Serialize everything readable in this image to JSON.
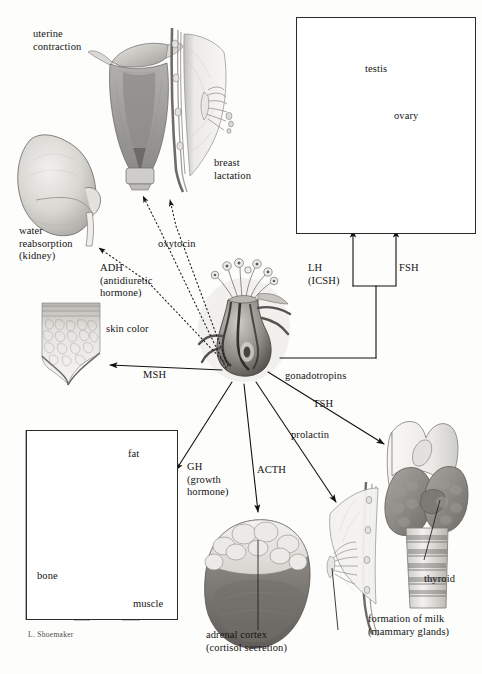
{
  "figure": {
    "signature": "L. Shoemaker",
    "background_color": "#fdfdfb",
    "ink_color": "#141414"
  },
  "labels": {
    "uterine_contraction": "uterine\ncontraction",
    "breast_lactation": "breast\nlactation",
    "water_reabsorption": "water\nreabsorption\n(kidney)",
    "adh": "ADH\n(antidiuretic\nhormone)",
    "oxytocin": "oxytocin",
    "skin_color": "skin color",
    "msh": "MSH",
    "gh": "GH\n(growth\nhormone)",
    "acth": "ACTH",
    "prolactin": "prolactin",
    "tsh": "TSH",
    "gonadotropins": "gonadotropins",
    "lh": "LH\n(ICSH)",
    "fsh": "FSH",
    "testis": "testis",
    "ovary": "ovary",
    "fat": "fat",
    "bone": "bone",
    "muscle": "muscle",
    "thyroid": "thyroid",
    "formation_of_milk": "formation of milk\n(mammary glands)",
    "adrenal_cortex": "adrenal cortex\n(cortisol secretion)"
  },
  "organs": [
    {
      "name": "uterus",
      "label": "uterine contraction"
    },
    {
      "name": "breast-lactating",
      "label": "breast lactation"
    },
    {
      "name": "kidney",
      "label": "water reabsorption (kidney)"
    },
    {
      "name": "skin-section",
      "label": "skin color"
    },
    {
      "name": "pituitary-gland",
      "label": "pituitary"
    },
    {
      "name": "testis",
      "label": "testis"
    },
    {
      "name": "ovary",
      "label": "ovary"
    },
    {
      "name": "fat-tissue",
      "label": "fat"
    },
    {
      "name": "bone-femur",
      "label": "bone"
    },
    {
      "name": "muscle",
      "label": "muscle"
    },
    {
      "name": "adrenal-gland",
      "label": "adrenal cortex"
    },
    {
      "name": "breast-mammary",
      "label": "formation of milk"
    },
    {
      "name": "thyroid-gland",
      "label": "thyroid"
    }
  ],
  "hormone_arrows": [
    {
      "hormone": "oxytocin",
      "target": "uterus",
      "style": "dotted"
    },
    {
      "hormone": "oxytocin",
      "target": "breast",
      "style": "dotted"
    },
    {
      "hormone": "ADH",
      "target": "kidney",
      "style": "dotted"
    },
    {
      "hormone": "MSH",
      "target": "skin",
      "style": "solid"
    },
    {
      "hormone": "GH",
      "target": "bone-fat-muscle",
      "style": "solid"
    },
    {
      "hormone": "ACTH",
      "target": "adrenal-cortex",
      "style": "solid"
    },
    {
      "hormone": "prolactin",
      "target": "mammary-glands",
      "style": "solid"
    },
    {
      "hormone": "TSH",
      "target": "thyroid",
      "style": "solid"
    },
    {
      "hormone": "gonadotropins",
      "target": "gonads",
      "style": "solid"
    },
    {
      "hormone": "LH (ICSH)",
      "target": "testis-ovary",
      "style": "solid"
    },
    {
      "hormone": "FSH",
      "target": "testis-ovary",
      "style": "solid"
    }
  ]
}
